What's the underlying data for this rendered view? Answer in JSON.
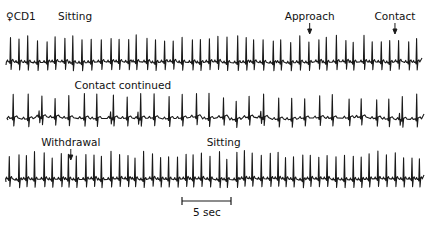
{
  "chart_data": {
    "type": "line",
    "title": "",
    "subject": "♀CD1",
    "scale_bar": {
      "label": "5 sec",
      "seconds": 5
    },
    "strips": [
      {
        "name": "strip-1",
        "annotations": [
          {
            "text": "Sitting",
            "type": "label",
            "time_frac": 0.14
          },
          {
            "text": "Approach",
            "type": "arrow",
            "time_frac": 0.73
          },
          {
            "text": "Contact",
            "type": "arrow",
            "time_frac": 0.935
          }
        ],
        "beats_count": 46,
        "baseline_noise": "low"
      },
      {
        "name": "strip-2",
        "annotations": [
          {
            "text": "Contact continued",
            "type": "label",
            "time_frac": 0.16
          }
        ],
        "beats_count": 30,
        "baseline_noise": "high"
      },
      {
        "name": "strip-3",
        "annotations": [
          {
            "text": "Withdrawal",
            "type": "arrow",
            "time_frac": 0.155
          },
          {
            "text": "Sitting",
            "type": "label",
            "time_frac": 0.48
          }
        ],
        "beats_count": 50,
        "baseline_noise": "low"
      }
    ],
    "xlabel": "",
    "ylabel": "",
    "grid": false
  }
}
